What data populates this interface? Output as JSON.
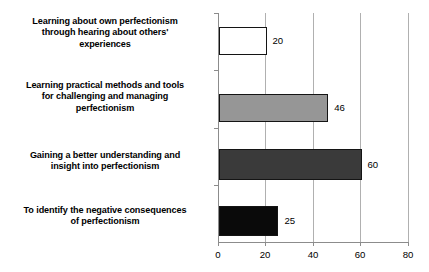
{
  "chart_data": {
    "type": "bar",
    "orientation": "horizontal",
    "title": "",
    "subtitle": "",
    "xlabel": "",
    "ylabel": "",
    "xlim": [
      0,
      80
    ],
    "xticks": [
      "0",
      "20",
      "40",
      "60",
      "80"
    ],
    "grid": true,
    "legend": false,
    "categories": [
      "Learning about own perfectionism through hearing about others' experiences",
      "Learning practical methods and tools for challenging and managing perfectionism",
      "Gaining a better understanding and insight into perfectionism",
      "To identify the negative consequences of perfectionism"
    ],
    "values": [
      20,
      46,
      60,
      25
    ],
    "value_labels": [
      "20",
      "46",
      "60",
      "25"
    ],
    "bar_colors": [
      "#ffffff",
      "#969696",
      "#3a3a3a",
      "#0a0a0a"
    ],
    "bar_border_color": "#141414",
    "axis_color": "#8c8c8c",
    "gridline_color": "#b0b0b0",
    "background": "#ffffff"
  },
  "category_lines": [
    [
      "Learning about own perfectionism",
      "through hearing about others'",
      "experiences"
    ],
    [
      "Learning practical methods and tools",
      "for challenging and managing",
      "perfectionism"
    ],
    [
      "Gaining a better understanding and",
      "insight into perfectionism"
    ],
    [
      "To identify the negative consequences",
      "of perfectionism"
    ]
  ]
}
